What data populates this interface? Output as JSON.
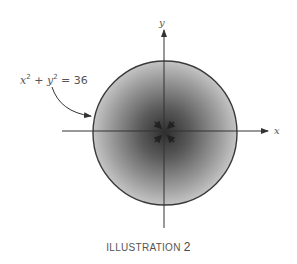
{
  "figure": {
    "equation": {
      "lhs_x": "x",
      "exp1": "2",
      "plus": " + ",
      "lhs_y": "y",
      "exp2": "2",
      "rhs": " = 36"
    },
    "axis_labels": {
      "x": "x",
      "y": "y"
    },
    "caption": {
      "word": "ILLUSTRATION",
      "number": "2"
    },
    "colors": {
      "circle_stroke": "#3a3a3a",
      "shade_center": "#2e2e2e",
      "shade_edge": "#bdbdbd",
      "axis": "#333333",
      "text": "#555555"
    }
  }
}
